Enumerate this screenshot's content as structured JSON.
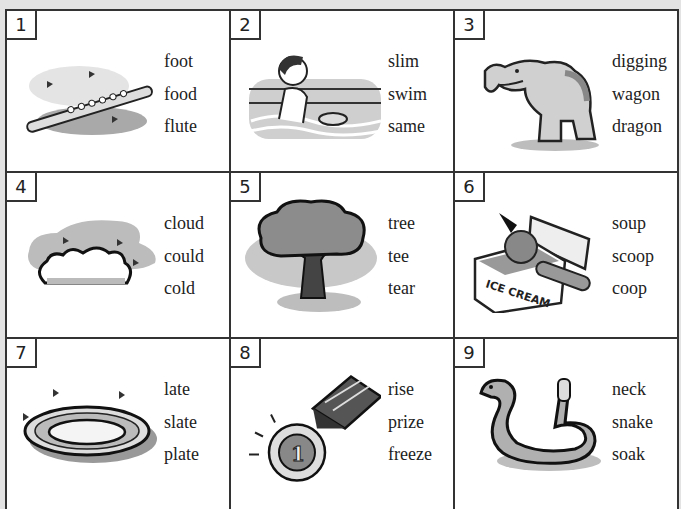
{
  "items": [
    {
      "number": "1",
      "picture": "flute",
      "words": [
        "foot",
        "food",
        "flute"
      ]
    },
    {
      "number": "2",
      "picture": "boy-swimming",
      "words": [
        "slim",
        "swim",
        "same"
      ]
    },
    {
      "number": "3",
      "picture": "dragon",
      "words": [
        "digging",
        "wagon",
        "dragon"
      ]
    },
    {
      "number": "4",
      "picture": "cloud",
      "words": [
        "cloud",
        "could",
        "cold"
      ]
    },
    {
      "number": "5",
      "picture": "tree",
      "words": [
        "tree",
        "tee",
        "tear"
      ]
    },
    {
      "number": "6",
      "picture": "ice-cream-scoop",
      "words": [
        "soup",
        "scoop",
        "coop"
      ],
      "box_label": "ICE CREAM"
    },
    {
      "number": "7",
      "picture": "plate",
      "words": [
        "late",
        "slate",
        "plate"
      ]
    },
    {
      "number": "8",
      "picture": "prize-medal",
      "words": [
        "rise",
        "prize",
        "freeze"
      ],
      "medal_label": "1"
    },
    {
      "number": "9",
      "picture": "snake",
      "words": [
        "neck",
        "snake",
        "soak"
      ]
    }
  ],
  "colors": {
    "background": "#e3e3e3",
    "border": "#333333",
    "shadow": "#bdbdbd",
    "dark": "#555555"
  }
}
